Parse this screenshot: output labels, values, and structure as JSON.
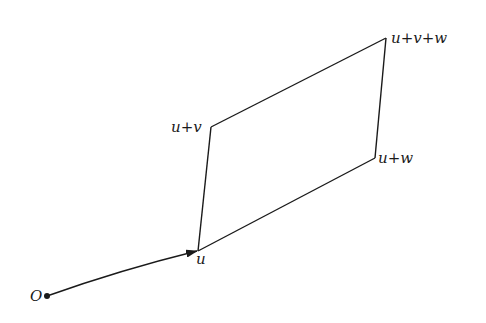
{
  "diagram": {
    "type": "vector-parallelogram",
    "colors": {
      "stroke": "#1a1a1a",
      "background": "#ffffff"
    },
    "points": {
      "origin": {
        "label": "O",
        "x": 47,
        "y": 296
      },
      "u": {
        "label": "u",
        "x": 198,
        "y": 251
      },
      "u_plus_v": {
        "label": "u+v",
        "x": 211,
        "y": 127
      },
      "u_plus_w": {
        "label": "u+w",
        "x": 375,
        "y": 158
      },
      "u_plus_v_plus_w": {
        "label": "u+v+w",
        "x": 386,
        "y": 38
      }
    },
    "edges": [
      {
        "from": "origin",
        "to": "u",
        "arrow": true,
        "curved": true
      },
      {
        "from": "u",
        "to": "u_plus_v",
        "arrow": false
      },
      {
        "from": "u",
        "to": "u_plus_w",
        "arrow": false
      },
      {
        "from": "u_plus_v",
        "to": "u_plus_v_plus_w",
        "arrow": false
      },
      {
        "from": "u_plus_w",
        "to": "u_plus_v_plus_w",
        "arrow": false
      }
    ]
  }
}
